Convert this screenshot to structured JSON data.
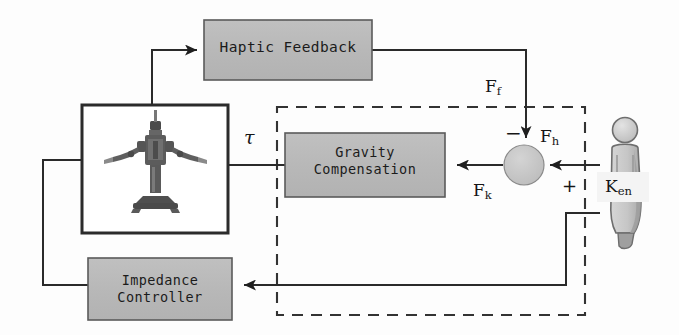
{
  "diagram": {
    "type": "control-block-diagram",
    "canvas": {
      "width": 679,
      "height": 335,
      "background": "#fdfdfd"
    },
    "colors": {
      "block_fill": "#b9b9b9",
      "block_stroke": "#4a4a4a",
      "line": "#2a2a2a",
      "dashed_boundary": "#333333",
      "robot_box_stroke": "#2b2b2b",
      "summing_fill": "#c6c6c6",
      "person_fill": "#c9c9c9",
      "person_stroke": "#6e6e6e",
      "text": "#1b1b1b"
    }
  },
  "blocks": {
    "haptic_feedback": {
      "label": "Haptic Feedback",
      "x": 204,
      "y": 20,
      "w": 168,
      "h": 60,
      "fill": "#b9b9b9"
    },
    "gravity_compensation": {
      "label": "Gravity\nCompensation",
      "x": 285,
      "y": 133,
      "w": 160,
      "h": 64,
      "fill": "#b9b9b9"
    },
    "impedance_controller": {
      "label": "Impedance\nController",
      "x": 88,
      "y": 258,
      "w": 144,
      "h": 62,
      "fill": "#b9b9b9"
    },
    "robot_enclosure": {
      "label": "",
      "x": 82,
      "y": 105,
      "w": 146,
      "h": 128,
      "fill": "#ffffff",
      "contents": "dual-arm-robot-photo"
    },
    "summing_junction": {
      "label": "",
      "cx": 524,
      "cy": 165,
      "r": 20,
      "fill": "#c6c6c6",
      "signs": {
        "top": "−",
        "right": "+"
      }
    },
    "human_operator": {
      "label": "K",
      "sublabel": "en",
      "x": 600,
      "y": 118,
      "w": 46,
      "h": 120,
      "fill": "#c9c9c9"
    }
  },
  "signals": {
    "tau": {
      "text": "τ",
      "x": 244,
      "y": 126
    },
    "Ff": {
      "base": "F",
      "sub": "f",
      "x": 485,
      "y": 76
    },
    "Fh": {
      "base": "F",
      "sub": "h",
      "x": 540,
      "y": 126
    },
    "Fk": {
      "base": "F",
      "sub": "k",
      "x": 473,
      "y": 180
    },
    "Ken": {
      "base": "K",
      "sub": "en",
      "x": 605,
      "y": 176
    },
    "minus_sign": {
      "text": "−",
      "x": 505,
      "y": 121
    },
    "plus_sign": {
      "text": "+",
      "x": 562,
      "y": 175
    }
  },
  "boundary": {
    "name": "human-robot-interaction-boundary",
    "style": "dashed",
    "x": 277,
    "y": 107,
    "w": 308,
    "h": 208
  },
  "connections": [
    {
      "name": "robot-to-haptic-feedback",
      "from": "robot_enclosure",
      "to": "haptic_feedback",
      "arrow": "to"
    },
    {
      "name": "haptic-feedback-to-summing",
      "from": "haptic_feedback",
      "to": "summing_junction",
      "arrow": "to",
      "signal": "Ff"
    },
    {
      "name": "human-to-summing",
      "from": "human_operator",
      "to": "summing_junction",
      "arrow": "to",
      "signal": "Fh"
    },
    {
      "name": "summing-to-gravity",
      "from": "summing_junction",
      "to": "gravity_compensation",
      "arrow": "to",
      "signal": "Fk"
    },
    {
      "name": "gravity-to-robot",
      "from": "gravity_compensation",
      "to": "robot_enclosure",
      "arrow": "to",
      "signal": "tau"
    },
    {
      "name": "human-to-impedance",
      "from": "human_operator",
      "to": "impedance_controller",
      "arrow": "to"
    },
    {
      "name": "impedance-to-robot",
      "from": "impedance_controller",
      "to": "robot_enclosure",
      "arrow": "to"
    }
  ]
}
